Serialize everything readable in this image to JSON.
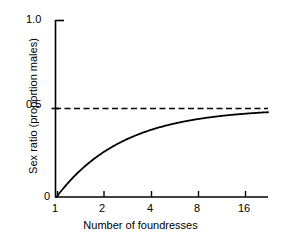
{
  "chart_data": {
    "type": "line",
    "title": "",
    "xlabel": "Number of foundresses",
    "ylabel": "Sex ratio (proportion males)",
    "xscale": "log2",
    "xlim": [
      1,
      24
    ],
    "ylim": [
      0,
      1.0
    ],
    "grid": false,
    "legend": null,
    "xticks": [
      1,
      2,
      4,
      8,
      16
    ],
    "xtick_labels": [
      "1",
      "2",
      "4",
      "8",
      "16"
    ],
    "yticks": [
      0,
      0.5,
      1.0
    ],
    "ytick_labels": [
      "0",
      "0.5",
      "1.0"
    ],
    "series": [
      {
        "name": "sex ratio",
        "style": "solid",
        "color": "#000000",
        "formula": "(n-1)/(2n)",
        "x": [
          1,
          1.1,
          1.25,
          1.5,
          1.75,
          2,
          2.5,
          3,
          4,
          5,
          6,
          8,
          10,
          12,
          16,
          20,
          24
        ],
        "y": [
          0,
          0.045,
          0.1,
          0.167,
          0.214,
          0.25,
          0.3,
          0.333,
          0.375,
          0.4,
          0.417,
          0.438,
          0.45,
          0.458,
          0.469,
          0.475,
          0.479
        ]
      },
      {
        "name": "asymptote",
        "style": "dashed",
        "color": "#000000",
        "value": 0.5
      }
    ],
    "annotations": []
  },
  "axis_labels": {
    "x_title": "Number of foundresses",
    "y_title": "Sex ratio (proportion males)",
    "y_top": "1.0",
    "y_mid": "0.5",
    "y_zero": "0",
    "x_1": "1",
    "x_2": "2",
    "x_4": "4",
    "x_8": "8",
    "x_16": "16"
  },
  "colors": {
    "background": "#ffffff",
    "ink": "#000000"
  }
}
